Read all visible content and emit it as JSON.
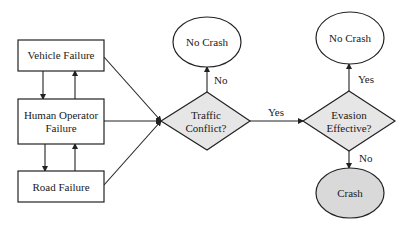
{
  "diagram": {
    "type": "flowchart",
    "colors": {
      "stroke": "#222222",
      "box_fill": "#ffffff",
      "decision_fill": "#e6e6e6",
      "terminal_fill": "#ffffff",
      "crash_fill": "#d9d9d9"
    },
    "nodes": {
      "vehicle_failure": {
        "label": "Vehicle Failure",
        "shape": "rectangle"
      },
      "human_operator_failure": {
        "label_line1": "Human Operator",
        "label_line2": "Failure",
        "shape": "rectangle"
      },
      "road_failure": {
        "label": "Road Failure",
        "shape": "rectangle"
      },
      "traffic_conflict": {
        "label_line1": "Traffic",
        "label_line2": "Conflict?",
        "shape": "diamond"
      },
      "no_crash_1": {
        "label": "No Crash",
        "shape": "ellipse"
      },
      "evasion_effective": {
        "label_line1": "Evasion",
        "label_line2": "Effective?",
        "shape": "diamond"
      },
      "no_crash_2": {
        "label": "No Crash",
        "shape": "ellipse"
      },
      "crash": {
        "label": "Crash",
        "shape": "ellipse"
      }
    },
    "edges": {
      "traffic_no": {
        "from": "Traffic Conflict?",
        "to": "No Crash",
        "label": "No"
      },
      "traffic_yes": {
        "from": "Traffic Conflict?",
        "to": "Evasion Effective?",
        "label": "Yes"
      },
      "evasion_yes": {
        "from": "Evasion Effective?",
        "to": "No Crash",
        "label": "Yes"
      },
      "evasion_no": {
        "from": "Evasion Effective?",
        "to": "Crash",
        "label": "No"
      }
    }
  }
}
